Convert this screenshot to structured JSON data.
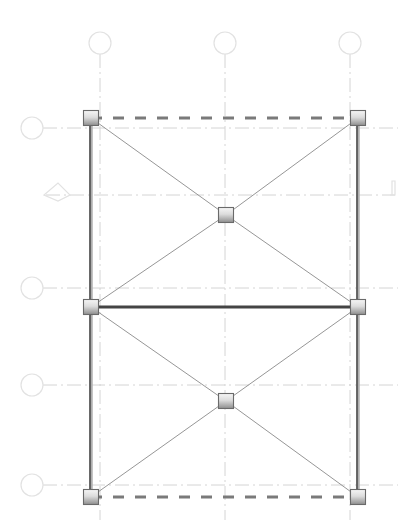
{
  "diagram": {
    "type": "structural-frame-bracing",
    "width": 413,
    "height": 525,
    "colors": {
      "background": "#ffffff",
      "grid_line": "#d4d4d4",
      "grid_bubble": "#e2e2e2",
      "column": "#3a3a3a",
      "beam_solid": "#444444",
      "beam_dashed": "#7a7a7a",
      "brace": "#8a8a8a",
      "node_top": "#f4f4f4",
      "node_bottom": "#9a9a9a",
      "node_border": "#6a6a6a"
    },
    "grid_columns": [
      {
        "id": "col-grid-1",
        "x": 100,
        "bubble_y": 43
      },
      {
        "id": "col-grid-2",
        "x": 225,
        "bubble_y": 43
      },
      {
        "id": "col-grid-3",
        "x": 350,
        "bubble_y": 43
      }
    ],
    "grid_rows": [
      {
        "id": "row-grid-1",
        "y": 128,
        "bubble_x": 32,
        "marker": "circle"
      },
      {
        "id": "row-grid-2",
        "y": 195,
        "bubble_x": 58,
        "marker": "level",
        "end_marker": "bracket"
      },
      {
        "id": "row-grid-3",
        "y": 288,
        "bubble_x": 32,
        "marker": "circle"
      },
      {
        "id": "row-grid-4",
        "y": 385,
        "bubble_x": 32,
        "marker": "circle"
      },
      {
        "id": "row-grid-5",
        "y": 485,
        "bubble_x": 32,
        "marker": "circle"
      }
    ],
    "nodes": [
      {
        "id": "n1",
        "x": 91,
        "y": 118
      },
      {
        "id": "n2",
        "x": 358,
        "y": 118
      },
      {
        "id": "n3",
        "x": 91,
        "y": 307
      },
      {
        "id": "n4",
        "x": 358,
        "y": 307
      },
      {
        "id": "n5",
        "x": 91,
        "y": 497
      },
      {
        "id": "n6",
        "x": 358,
        "y": 497
      },
      {
        "id": "n7",
        "x": 226,
        "y": 215
      },
      {
        "id": "n8",
        "x": 226,
        "y": 401
      }
    ],
    "members": [
      {
        "id": "beam-top",
        "from": "n1",
        "to": "n2",
        "style": "dashed"
      },
      {
        "id": "beam-middle",
        "from": "n3",
        "to": "n4",
        "style": "solid"
      },
      {
        "id": "beam-bottom",
        "from": "n5",
        "to": "n6",
        "style": "dashed"
      },
      {
        "id": "column-left-upper",
        "from": "n1",
        "to": "n3",
        "style": "column"
      },
      {
        "id": "column-left-lower",
        "from": "n3",
        "to": "n5",
        "style": "column"
      },
      {
        "id": "column-right-upper",
        "from": "n2",
        "to": "n4",
        "style": "column"
      },
      {
        "id": "column-right-lower",
        "from": "n4",
        "to": "n6",
        "style": "column"
      },
      {
        "id": "brace-1",
        "from": "n1",
        "to": "n7",
        "style": "brace"
      },
      {
        "id": "brace-2",
        "from": "n2",
        "to": "n7",
        "style": "brace"
      },
      {
        "id": "brace-3",
        "from": "n3",
        "to": "n7",
        "style": "brace"
      },
      {
        "id": "brace-4",
        "from": "n4",
        "to": "n7",
        "style": "brace"
      },
      {
        "id": "brace-5",
        "from": "n3",
        "to": "n8",
        "style": "brace"
      },
      {
        "id": "brace-6",
        "from": "n4",
        "to": "n8",
        "style": "brace"
      },
      {
        "id": "brace-7",
        "from": "n5",
        "to": "n8",
        "style": "brace"
      },
      {
        "id": "brace-8",
        "from": "n6",
        "to": "n8",
        "style": "brace"
      }
    ]
  }
}
